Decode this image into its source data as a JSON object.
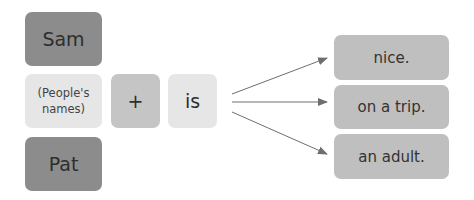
{
  "subjects": {
    "top": "Sam",
    "middle": "(People's names)",
    "bottom": "Pat"
  },
  "operator": "+",
  "verb": "is",
  "predicates": [
    "nice.",
    "on a trip.",
    "an adult."
  ],
  "colors": {
    "dark_box": "#8c8c8c",
    "operator_box": "#c5c5c5",
    "light_box": "#e6e6e6",
    "predicate_box": "#bfbfbf",
    "arrow": "#6e6e6e"
  }
}
